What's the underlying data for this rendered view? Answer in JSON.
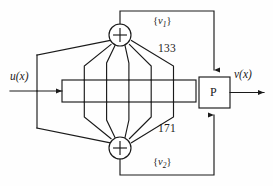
{
  "figure": {
    "type": "convolutional-encoder-block-diagram",
    "title": "",
    "background_color": "#fefefe",
    "line_color": "#1a1a1a",
    "text_color": "#1a1a1a"
  },
  "labels": {
    "input": "u(x)",
    "output": "v(x)",
    "puncture_block": "P",
    "generator_top": "133",
    "generator_bottom": "171",
    "codeword_top_open": "{",
    "codeword_top_var": "v",
    "codeword_top_sub": "1",
    "codeword_top_close": "}",
    "codeword_bottom_open": "{",
    "codeword_bottom_var": "v",
    "codeword_bottom_sub": "2",
    "codeword_bottom_close": "}",
    "adder_symbol": "+"
  },
  "shift_register": {
    "cell_count": 6,
    "x": 62,
    "y": 80,
    "width": 134,
    "height": 22
  },
  "adders": {
    "top": {
      "cx": 120,
      "cy": 35,
      "r": 11,
      "name": "modulo-2-adder-top"
    },
    "bottom": {
      "cx": 120,
      "cy": 148,
      "r": 11,
      "name": "modulo-2-adder-bottom"
    }
  },
  "puncture": {
    "x": 199,
    "y": 77,
    "width": 31,
    "height": 31
  },
  "taps": {
    "top_tap_count": 6,
    "bottom_tap_count": 6
  }
}
